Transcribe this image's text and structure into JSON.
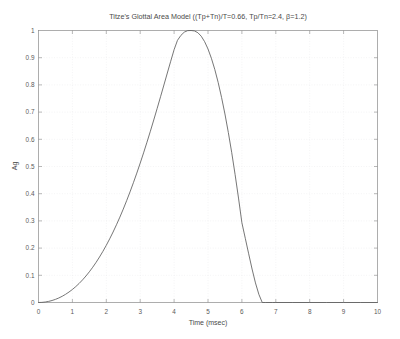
{
  "figure": {
    "background_color": "#ffffff",
    "line_color": "#5d5d5d",
    "axis_color": "#8a8a8a",
    "grid_color": "#e9e9ea"
  },
  "chart_data": {
    "type": "line",
    "title": "Titze's Glottal Area Model ((Tp+Tn)/T=0.66, Tp/Tn=2.4, β=1.2)",
    "xlabel": "Time (msec)",
    "ylabel": "Ag",
    "xlim": [
      0,
      10
    ],
    "ylim": [
      0,
      1
    ],
    "grid": true,
    "legend": null,
    "xticks": [
      0,
      1,
      2,
      3,
      4,
      5,
      6,
      7,
      8,
      9,
      10
    ],
    "xticklabels": [
      "0",
      "1",
      "2",
      "3",
      "4",
      "5",
      "6",
      "7",
      "8",
      "9",
      "10"
    ],
    "yticks": [
      0,
      0.1,
      0.2,
      0.3,
      0.4,
      0.5,
      0.6,
      0.7,
      0.8,
      0.9,
      1
    ],
    "yticklabels": [
      "0",
      "0.1",
      "0.2",
      "0.3",
      "0.4",
      "0.5",
      "0.6",
      "0.7",
      "0.8",
      "0.9",
      "1"
    ],
    "parameters": {
      "open_quotient": 0.66,
      "speed_ratio": 2.4,
      "beta": 1.2,
      "peak_time_msec": 4.66,
      "closure_time_msec": 6.6,
      "period_msec": 10
    },
    "series": [
      {
        "name": "Ag",
        "x": [
          0.0,
          0.1,
          0.2,
          0.3,
          0.4,
          0.5,
          0.6,
          0.7,
          0.8,
          0.9,
          1.0,
          1.1,
          1.2,
          1.3,
          1.4,
          1.5,
          1.6,
          1.7,
          1.8,
          1.9,
          2.0,
          2.1,
          2.2,
          2.3,
          2.4,
          2.5,
          2.6,
          2.7,
          2.8,
          2.9,
          3.0,
          3.1,
          3.2,
          3.3,
          3.4,
          3.5,
          3.6,
          3.7,
          3.8,
          3.9,
          4.0,
          4.1,
          4.2,
          4.3,
          4.4,
          4.5,
          4.6,
          4.7,
          4.8,
          4.9,
          5.0,
          5.1,
          5.2,
          5.3,
          5.4,
          5.5,
          5.6,
          5.7,
          5.8,
          5.9,
          6.0,
          6.1,
          6.2,
          6.3,
          6.4,
          6.5,
          6.6,
          6.7,
          6.8,
          6.9,
          7.0,
          7.5,
          8.0,
          8.5,
          9.0,
          9.5,
          10.0
        ],
        "y": [
          0.0,
          0.0004,
          0.0018,
          0.0041,
          0.0073,
          0.0115,
          0.0167,
          0.0229,
          0.0302,
          0.0385,
          0.0479,
          0.0585,
          0.0702,
          0.0832,
          0.0974,
          0.1129,
          0.1297,
          0.1478,
          0.1673,
          0.1881,
          0.2104,
          0.2341,
          0.2592,
          0.2858,
          0.3138,
          0.3433,
          0.3743,
          0.4067,
          0.4405,
          0.4757,
          0.5123,
          0.5502,
          0.5894,
          0.6297,
          0.6711,
          0.7134,
          0.7564,
          0.7999,
          0.8436,
          0.887,
          0.9295,
          0.964,
          0.982,
          0.994,
          0.9995,
          1.0,
          0.9985,
          0.992,
          0.979,
          0.959,
          0.932,
          0.898,
          0.857,
          0.809,
          0.754,
          0.693,
          0.625,
          0.551,
          0.47,
          0.384,
          0.293,
          0.236,
          0.179,
          0.123,
          0.072,
          0.03,
          0.0,
          0.0,
          0.0,
          0.0,
          0.0,
          0.0,
          0.0,
          0.0,
          0.0,
          0.0,
          0.0
        ]
      }
    ]
  }
}
